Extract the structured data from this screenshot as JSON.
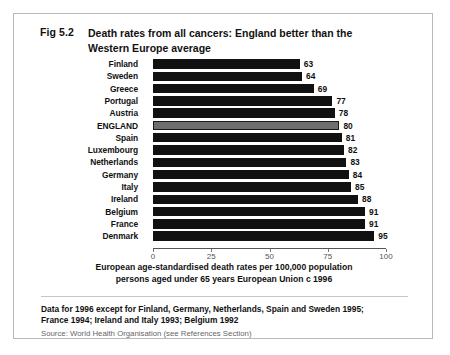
{
  "figure": {
    "number": "Fig 5.2",
    "title": "Death rates from all cancers:  England better than the Western Europe average"
  },
  "chart_data": {
    "type": "bar",
    "orientation": "horizontal",
    "title": "Death rates from all cancers:  England better than the Western Europe average",
    "xlabel": "European age-standardised death rates per 100,000 population persons aged under 65 years European Union c 1996",
    "ylabel": "",
    "xlim": [
      0,
      100
    ],
    "xticks": [
      0,
      25,
      50,
      75,
      100
    ],
    "xtick_labels": [
      "0",
      "25",
      "50",
      "75",
      "100"
    ],
    "grid": false,
    "legend": "none",
    "highlight_category": "ENGLAND",
    "highlight_color": "#6e6e6e",
    "bar_color": "#111111",
    "categories": [
      "Finland",
      "Sweden",
      "Greece",
      "Portugal",
      "Austria",
      "ENGLAND",
      "Spain",
      "Luxembourg",
      "Netherlands",
      "Germany",
      "Italy",
      "Ireland",
      "Belgium",
      "France",
      "Denmark"
    ],
    "values": [
      63,
      64,
      69,
      77,
      78,
      80,
      81,
      82,
      83,
      84,
      85,
      88,
      91,
      91,
      95
    ]
  },
  "axis_caption": {
    "line1": "European age-standardised death rates per 100,000 population",
    "line2": "persons aged under 65 years European Union c 1996"
  },
  "footnote": {
    "line1": "Data for 1996 except for Finland, Germany, Netherlands, Spain and Sweden 1995;",
    "line2": "France 1994; Ireland and Italy 1993; Belgium 1992",
    "source": "Source: World Health Organisation (see References Section)"
  }
}
